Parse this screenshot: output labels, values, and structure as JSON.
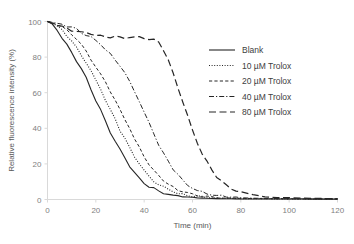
{
  "chart_data": {
    "type": "line",
    "title": "",
    "xlabel": "Time (min)",
    "ylabel": "Relative fluorescence intensity (%)",
    "xlim": [
      0,
      120
    ],
    "ylim": [
      0,
      100
    ],
    "xticks": [
      0,
      20,
      40,
      60,
      80,
      100,
      120
    ],
    "yticks": [
      0,
      20,
      40,
      60,
      80,
      100
    ],
    "grid": false,
    "legend_position": "upper-right",
    "x": [
      0,
      2,
      4,
      6,
      8,
      10,
      12,
      14,
      16,
      18,
      20,
      22,
      24,
      26,
      28,
      30,
      32,
      34,
      36,
      38,
      40,
      42,
      44,
      46,
      48,
      50,
      52,
      54,
      56,
      58,
      60,
      62,
      64,
      66,
      68,
      70,
      72,
      74,
      76,
      78,
      80,
      85,
      90,
      95,
      100,
      105,
      110,
      115,
      120
    ],
    "series": [
      {
        "name": "Blank",
        "style": "solid",
        "color": "#262626",
        "values": [
          100,
          98,
          95,
          91,
          87,
          83,
          78,
          73,
          68,
          62,
          56,
          50,
          44,
          38,
          33,
          28,
          23,
          19,
          15,
          12,
          9.5,
          7.5,
          6,
          4.8,
          3.8,
          3,
          2.4,
          2,
          1.6,
          1.3,
          1.1,
          0.9,
          0.8,
          0.7,
          0.6,
          0.5,
          0.45,
          0.4,
          0.38,
          0.35,
          0.32,
          0.3,
          0.28,
          0.26,
          0.25,
          0.24,
          0.23,
          0.22,
          0.2
        ]
      },
      {
        "name": "10 µM Trolox",
        "style": "dotted",
        "color": "#262626",
        "values": [
          100,
          99,
          97,
          95,
          92,
          89,
          85,
          81,
          77,
          72,
          67,
          62,
          56,
          50,
          45,
          39,
          34,
          29,
          24,
          20,
          16,
          13,
          10.5,
          8.5,
          6.8,
          5.4,
          4.3,
          3.5,
          2.8,
          2.3,
          1.9,
          1.6,
          1.3,
          1.1,
          0.95,
          0.85,
          0.75,
          0.68,
          0.6,
          0.55,
          0.5,
          0.45,
          0.4,
          0.36,
          0.33,
          0.3,
          0.28,
          0.26,
          0.24
        ]
      },
      {
        "name": "20 µM Trolox",
        "style": "dashed",
        "color": "#262626",
        "values": [
          100,
          99.5,
          98.5,
          97,
          95,
          93,
          90,
          87,
          83,
          79,
          75,
          70,
          66,
          61,
          56,
          50,
          45,
          40,
          34,
          29,
          24,
          20,
          16.5,
          13.5,
          11,
          8.8,
          7,
          5.6,
          4.5,
          3.6,
          2.9,
          2.4,
          2,
          1.7,
          1.4,
          1.2,
          1.05,
          0.9,
          0.8,
          0.72,
          0.65,
          0.55,
          0.48,
          0.42,
          0.38,
          0.34,
          0.31,
          0.28,
          0.26
        ]
      },
      {
        "name": "40 µM Trolox",
        "style": "dashdot",
        "color": "#262626",
        "values": [
          100,
          99.5,
          99,
          98.5,
          97.5,
          96.5,
          95.5,
          94,
          92.5,
          91,
          89,
          87,
          84.5,
          82,
          79,
          75,
          71,
          66,
          61,
          55,
          49,
          43,
          37,
          31,
          26,
          21,
          17,
          13.5,
          10.5,
          8.2,
          6.4,
          5,
          4,
          3.2,
          2.6,
          2.1,
          1.8,
          1.5,
          1.3,
          1.1,
          0.95,
          0.75,
          0.6,
          0.5,
          0.44,
          0.4,
          0.36,
          0.32,
          0.3
        ]
      },
      {
        "name": "80 µM Trolox",
        "style": "longdash",
        "color": "#262626",
        "values": [
          100,
          99,
          98,
          97,
          96,
          95,
          94.5,
          94,
          93.5,
          93,
          92.5,
          92,
          91.8,
          91.5,
          91.3,
          91.2,
          91,
          91,
          90.8,
          90.8,
          90.5,
          90.5,
          90,
          88,
          84,
          78,
          71,
          63,
          55,
          47,
          39,
          32,
          26,
          21,
          16.5,
          13,
          10,
          8,
          6.3,
          5,
          4,
          2.6,
          1.8,
          1.3,
          1,
          0.8,
          0.65,
          0.55,
          0.45
        ]
      }
    ]
  },
  "legend": {
    "items": [
      {
        "label": "Blank"
      },
      {
        "label": "10 µM Trolox"
      },
      {
        "label": "20 µM Trolox"
      },
      {
        "label": "40 µM Trolox"
      },
      {
        "label": "80 µM Trolox"
      }
    ]
  }
}
